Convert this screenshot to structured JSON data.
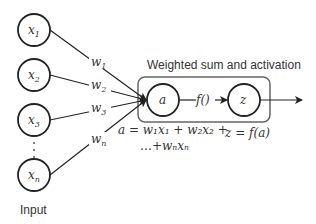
{
  "diagram": {
    "title": "Weighted sum and activation",
    "input_label": "Input",
    "inputs": [
      {
        "label": "x",
        "sub": "1"
      },
      {
        "label": "x",
        "sub": "2"
      },
      {
        "label": "x",
        "sub": "3"
      },
      {
        "label": "x",
        "sub": "n"
      }
    ],
    "weights": [
      {
        "label": "w",
        "sub": "1"
      },
      {
        "label": "w",
        "sub": "2"
      },
      {
        "label": "w",
        "sub": "3"
      },
      {
        "label": "w",
        "sub": "n"
      }
    ],
    "sum_node": "a",
    "activation_node": "z",
    "activation_edge_label": "f()",
    "sum_equation_line1": "a = w₁x₁ + w₂x₂ +",
    "sum_equation_line2": "…+wₙxₙ",
    "activation_equation": "z = f(a)",
    "ellipsis": "⋮",
    "colors": {
      "stroke": "#222222",
      "box": "#666666",
      "text": "#333333"
    }
  }
}
